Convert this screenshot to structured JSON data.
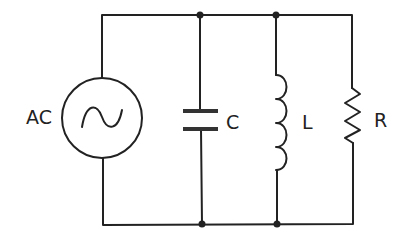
{
  "diagram": {
    "type": "parallel RLC circuit",
    "source": {
      "label": "AC",
      "symbol": "sine-wave"
    },
    "components": [
      {
        "id": "capacitor",
        "label": "C"
      },
      {
        "id": "inductor",
        "label": "L"
      },
      {
        "id": "resistor",
        "label": "R"
      }
    ],
    "colors": {
      "line": "#222222",
      "background": "#ffffff"
    }
  }
}
